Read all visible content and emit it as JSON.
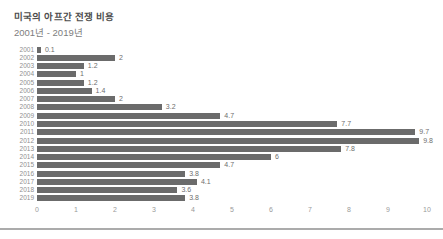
{
  "card": {
    "title": "미국의 아프간 전쟁 비용",
    "subtitle": "2001년 - 2019년"
  },
  "chart_data": {
    "type": "bar",
    "orientation": "horizontal",
    "title": "미국의 아프간 전쟁 비용",
    "subtitle": "2001년 - 2019년",
    "categories": [
      "2001",
      "2002",
      "2003",
      "2004",
      "2005",
      "2006",
      "2007",
      "2008",
      "2009",
      "2010",
      "2011",
      "2012",
      "2013",
      "2014",
      "2015",
      "2016",
      "2017",
      "2018",
      "2019"
    ],
    "values": [
      0.1,
      2,
      1.2,
      1,
      1.2,
      1.4,
      2,
      3.2,
      4.7,
      7.7,
      9.7,
      9.8,
      7.8,
      6,
      4.7,
      3.8,
      4.1,
      3.6,
      3.8
    ],
    "value_labels": [
      "0.1",
      "2",
      "1.2",
      "1",
      "1.2",
      "1.4",
      "2",
      "3.2",
      "4.7",
      "7.7",
      "9.7",
      "9.8",
      "7.8",
      "6",
      "4.7",
      "3.8",
      "4.1",
      "3.6",
      "3.8"
    ],
    "xlabel": "",
    "ylabel": "",
    "xlim": [
      0,
      10
    ],
    "x_ticks": [
      0,
      1,
      2,
      3,
      4,
      5,
      6,
      7,
      8,
      9,
      10
    ],
    "grid": false,
    "legend": "none",
    "bar_color": "#6b6b6b",
    "year_label_color": "#8f8f8f",
    "value_label_color": "#6e6e6e",
    "tick_label_color": "#9a9a9a",
    "px_per_unit": 39
  }
}
